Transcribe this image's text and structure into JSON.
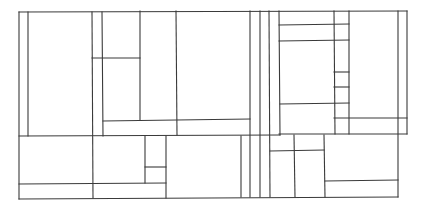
{
  "diagram": {
    "type": "rectangle-subdivision",
    "line_color": "#3a3a3a",
    "background": "#ffffff",
    "lines": [
      {
        "id": "top-border",
        "x1": 19,
        "y1": 12,
        "x2": 407,
        "y2": 11
      },
      {
        "id": "mid-divider-left",
        "x1": 19,
        "y1": 136,
        "x2": 280,
        "y2": 135
      },
      {
        "id": "mid-divider-right",
        "x1": 279,
        "y1": 134,
        "x2": 407,
        "y2": 134
      },
      {
        "id": "upper-right-border",
        "x1": 407,
        "y1": 11,
        "x2": 407,
        "y2": 134
      },
      {
        "id": "left-border",
        "x1": 19,
        "y1": 12,
        "x2": 19,
        "y2": 199
      },
      {
        "id": "v-28",
        "x1": 28,
        "y1": 12,
        "x2": 28,
        "y2": 136
      },
      {
        "id": "v-92",
        "x1": 92,
        "y1": 12,
        "x2": 93,
        "y2": 198
      },
      {
        "id": "v-102",
        "x1": 102,
        "y1": 12,
        "x2": 103,
        "y2": 136
      },
      {
        "id": "h-58",
        "x1": 92,
        "y1": 58,
        "x2": 140,
        "y2": 58
      },
      {
        "id": "v-140",
        "x1": 140,
        "y1": 11,
        "x2": 140,
        "y2": 120
      },
      {
        "id": "h-120",
        "x1": 103,
        "y1": 121,
        "x2": 250,
        "y2": 119
      },
      {
        "id": "v-176",
        "x1": 176,
        "y1": 11,
        "x2": 177,
        "y2": 135
      },
      {
        "id": "v-250",
        "x1": 250,
        "y1": 11,
        "x2": 250,
        "y2": 197
      },
      {
        "id": "v-260",
        "x1": 260,
        "y1": 11,
        "x2": 260,
        "y2": 197
      },
      {
        "id": "v-269",
        "x1": 269,
        "y1": 11,
        "x2": 270,
        "y2": 197
      },
      {
        "id": "v-279",
        "x1": 279,
        "y1": 11,
        "x2": 280,
        "y2": 135
      },
      {
        "id": "h-25",
        "x1": 279,
        "y1": 25,
        "x2": 349,
        "y2": 24
      },
      {
        "id": "h-40",
        "x1": 279,
        "y1": 41,
        "x2": 349,
        "y2": 40
      },
      {
        "id": "h-103",
        "x1": 280,
        "y1": 104,
        "x2": 349,
        "y2": 103
      },
      {
        "id": "v-334",
        "x1": 334,
        "y1": 11,
        "x2": 335,
        "y2": 134
      },
      {
        "id": "h-72",
        "x1": 334,
        "y1": 72,
        "x2": 349,
        "y2": 72
      },
      {
        "id": "h-87",
        "x1": 334,
        "y1": 87,
        "x2": 349,
        "y2": 87
      },
      {
        "id": "v-349",
        "x1": 349,
        "y1": 11,
        "x2": 349,
        "y2": 134
      },
      {
        "id": "h-118",
        "x1": 334,
        "y1": 118,
        "x2": 407,
        "y2": 118
      },
      {
        "id": "v-398",
        "x1": 398,
        "y1": 11,
        "x2": 398,
        "y2": 197
      },
      {
        "id": "h-184",
        "x1": 19,
        "y1": 184,
        "x2": 166,
        "y2": 183
      },
      {
        "id": "v-145",
        "x1": 145,
        "y1": 136,
        "x2": 145,
        "y2": 183
      },
      {
        "id": "h-167",
        "x1": 145,
        "y1": 167,
        "x2": 166,
        "y2": 167
      },
      {
        "id": "v-166",
        "x1": 166,
        "y1": 136,
        "x2": 166,
        "y2": 198
      },
      {
        "id": "v-241",
        "x1": 241,
        "y1": 136,
        "x2": 241,
        "y2": 197
      },
      {
        "id": "h-151",
        "x1": 270,
        "y1": 151,
        "x2": 324,
        "y2": 150
      },
      {
        "id": "v-294",
        "x1": 294,
        "y1": 135,
        "x2": 295,
        "y2": 197
      },
      {
        "id": "v-324",
        "x1": 324,
        "y1": 135,
        "x2": 325,
        "y2": 197
      },
      {
        "id": "h-181",
        "x1": 325,
        "y1": 181,
        "x2": 398,
        "y2": 180
      },
      {
        "id": "bottom-border",
        "x1": 19,
        "y1": 199,
        "x2": 398,
        "y2": 197
      }
    ]
  }
}
